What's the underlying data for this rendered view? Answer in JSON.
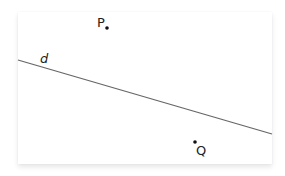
{
  "figure": {
    "line": {
      "label": "d",
      "x1": 18,
      "y1": 60,
      "x2": 272,
      "y2": 134,
      "color": "#666666"
    },
    "points": [
      {
        "label": "P",
        "x": 107,
        "y": 28
      },
      {
        "label": "Q",
        "x": 195,
        "y": 142
      }
    ],
    "point_color": "#111111"
  }
}
